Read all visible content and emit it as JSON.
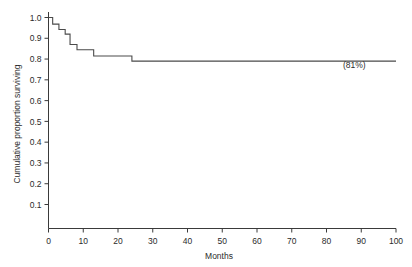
{
  "chart_data": {
    "type": "line",
    "title": "",
    "xlabel": "Months",
    "ylabel": "Cumulative proportion surviving",
    "xlim": [
      0,
      100
    ],
    "ylim": [
      0.04,
      1.0
    ],
    "grid": false,
    "legend": null,
    "step_style": "post",
    "xticks": [
      0,
      10,
      20,
      30,
      40,
      50,
      60,
      70,
      80,
      90,
      100
    ],
    "xticklabels": [
      "0",
      "10",
      "20",
      "30",
      "40",
      "50",
      "60",
      "70",
      "80",
      "90",
      "100"
    ],
    "yticks": [
      0.1,
      0.2,
      0.3,
      0.4,
      0.5,
      0.6,
      0.7,
      0.8,
      0.9,
      1.0
    ],
    "yticklabels": [
      "0.1",
      "0.2",
      "0.3",
      "0.4",
      "0.5",
      "0.6",
      "0.7",
      "0.8",
      "0.9",
      "1.0"
    ],
    "series": [
      {
        "name": "Cumulative survival",
        "x": [
          0,
          1.2,
          3.0,
          4.8,
          6.2,
          8.2,
          13.0,
          24.0,
          100
        ],
        "y": [
          1.0,
          0.968,
          0.942,
          0.92,
          0.87,
          0.845,
          0.815,
          0.79,
          0.79
        ]
      }
    ],
    "annotations": [
      {
        "text": "(81%)",
        "x": 88,
        "y": 0.755
      }
    ]
  }
}
